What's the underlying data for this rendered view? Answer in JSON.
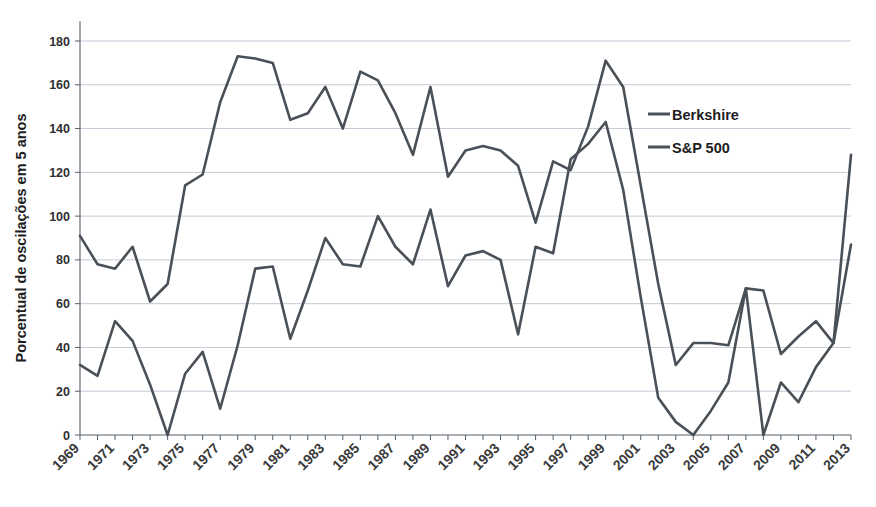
{
  "chart_data": {
    "type": "line",
    "title": "",
    "xlabel": "",
    "ylabel": "Porcentual de oscilações em 5 anos",
    "ylim": [
      0,
      180
    ],
    "ytick_labels": [
      "0",
      "20",
      "40",
      "60",
      "80",
      "100",
      "120",
      "140",
      "160",
      "180"
    ],
    "ytick_values": [
      0,
      20,
      40,
      60,
      80,
      100,
      120,
      140,
      160,
      180
    ],
    "grid": true,
    "legend_position": "upper-right-inside",
    "x": [
      1969,
      1970,
      1971,
      1972,
      1973,
      1974,
      1975,
      1976,
      1977,
      1978,
      1979,
      1980,
      1981,
      1982,
      1983,
      1984,
      1985,
      1986,
      1987,
      1988,
      1989,
      1990,
      1991,
      1992,
      1993,
      1994,
      1995,
      1996,
      1997,
      1998,
      1999,
      2000,
      2001,
      2002,
      2003,
      2004,
      2005,
      2006,
      2007,
      2008,
      2009,
      2010,
      2011,
      2012,
      2013
    ],
    "xtick_labels": [
      "1969",
      "1971",
      "1973",
      "1975",
      "1977",
      "1979",
      "1981",
      "1983",
      "1985",
      "1987",
      "1989",
      "1991",
      "1993",
      "1995",
      "1997",
      "1999",
      "2001",
      "2003",
      "2005",
      "2007",
      "2009",
      "2011",
      "2013"
    ],
    "xlim": [
      1969,
      2013
    ],
    "series": [
      {
        "name": "Berkshire",
        "color": "#4a5057",
        "values": [
          91,
          78,
          76,
          86,
          61,
          69,
          114,
          119,
          152,
          173,
          172,
          170,
          144,
          147,
          159,
          140,
          166,
          162,
          147,
          128,
          159,
          118,
          130,
          132,
          130,
          123,
          97,
          125,
          121,
          141,
          171,
          159,
          114,
          69,
          32,
          42,
          42,
          41,
          67,
          66,
          37,
          45,
          52,
          42,
          128
        ]
      },
      {
        "name": "S&P 500",
        "color": "#4a5057",
        "values": [
          32,
          27,
          52,
          43,
          23,
          0,
          28,
          38,
          12,
          41,
          76,
          77,
          44,
          66,
          90,
          78,
          77,
          100,
          86,
          78,
          103,
          68,
          82,
          84,
          80,
          46,
          86,
          83,
          126,
          133,
          143,
          112,
          63,
          17,
          6,
          0,
          11,
          24,
          67,
          0,
          24,
          15,
          31,
          42,
          87
        ]
      }
    ],
    "legend": [
      "Berkshire",
      "S&P 500"
    ]
  },
  "legend": {
    "items": [
      {
        "label": "Berkshire"
      },
      {
        "label": "S&P 500"
      }
    ]
  },
  "axes": {
    "y_title": "Porcentual de oscilações em 5 anos"
  }
}
